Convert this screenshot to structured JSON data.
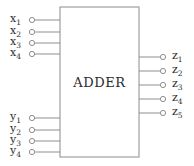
{
  "diagram": {
    "type": "block-diagram",
    "title": "ADDER",
    "block": {
      "label": "ADDER",
      "x": 60,
      "y": 7,
      "width": 79,
      "height": 150,
      "stroke": "#8c8c8c",
      "fill": "#ffffff"
    },
    "canvas": {
      "width": 194,
      "height": 166,
      "background": "#ffffff"
    },
    "style": {
      "line_color": "#8f8f8f",
      "terminal_stroke": "#8f8f8f",
      "terminal_fill": "#ffffff",
      "text_color": "#2b2b2b",
      "terminal_radius": 2.6
    },
    "inputs_x": [
      {
        "name": "x",
        "index": "1",
        "label": "x1",
        "cx": 32,
        "cy": 20,
        "label_x": 10,
        "label_y": 20
      },
      {
        "name": "x",
        "index": "2",
        "label": "x2",
        "cx": 32,
        "cy": 32,
        "label_x": 10,
        "label_y": 32
      },
      {
        "name": "x",
        "index": "3",
        "label": "x3",
        "cx": 32,
        "cy": 43,
        "label_x": 10,
        "label_y": 43
      },
      {
        "name": "x",
        "index": "4",
        "label": "x4",
        "cx": 32,
        "cy": 54,
        "label_x": 10,
        "label_y": 54
      }
    ],
    "inputs_y": [
      {
        "name": "y",
        "index": "1",
        "label": "y1",
        "cx": 32,
        "cy": 118,
        "label_x": 10,
        "label_y": 118
      },
      {
        "name": "y",
        "index": "2",
        "label": "y2",
        "cx": 32,
        "cy": 130,
        "label_x": 10,
        "label_y": 130
      },
      {
        "name": "y",
        "index": "3",
        "label": "y3",
        "cx": 32,
        "cy": 141,
        "label_x": 10,
        "label_y": 141
      },
      {
        "name": "y",
        "index": "4",
        "label": "y4",
        "cx": 32,
        "cy": 152,
        "label_x": 10,
        "label_y": 152
      }
    ],
    "outputs_z": [
      {
        "name": "z",
        "index": "1",
        "label": "z1",
        "cx": 163,
        "cy": 57,
        "label_x": 172,
        "label_y": 57
      },
      {
        "name": "z",
        "index": "2",
        "label": "z2",
        "cx": 163,
        "cy": 71,
        "label_x": 172,
        "label_y": 71
      },
      {
        "name": "z",
        "index": "3",
        "label": "z3",
        "cx": 163,
        "cy": 85,
        "label_x": 172,
        "label_y": 85
      },
      {
        "name": "z",
        "index": "4",
        "label": "z4",
        "cx": 163,
        "cy": 99,
        "label_x": 172,
        "label_y": 99
      },
      {
        "name": "z",
        "index": "5",
        "label": "z5",
        "cx": 163,
        "cy": 113,
        "label_x": 172,
        "label_y": 113
      }
    ]
  }
}
